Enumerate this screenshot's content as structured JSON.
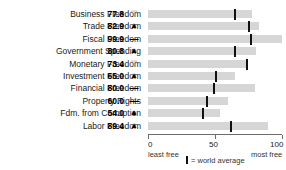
{
  "title_sliver": "ECONOMIC FREEDOM INDICATORS",
  "axis": {
    "ticks": [
      0,
      50,
      100
    ],
    "min_label": "least free",
    "max_label": "most free",
    "range": [
      0,
      100
    ]
  },
  "legend": {
    "marker_name": "world-average-marker",
    "text": "= world average"
  },
  "chart_data": {
    "type": "bar",
    "title": "",
    "xlabel": "",
    "ylabel": "",
    "xlim": [
      0,
      100
    ],
    "grid": false,
    "orientation": "horizontal",
    "legend_position": "bottom",
    "categories": [
      "Business Freedom",
      "Trade Freedom",
      "Fiscal Freedom",
      "Government Spending",
      "Monetary Freedom",
      "Investment Freedom",
      "Financial Freedom",
      "Property Rights",
      "Fdm. from Corruption",
      "Labor Freedom"
    ],
    "values": [
      77.8,
      82.9,
      99.9,
      80.8,
      73.4,
      65.0,
      80.0,
      60.0,
      54.0,
      89.4
    ],
    "value_labels": [
      "77.8",
      "82.9",
      "99.9",
      "80.8",
      "73.4",
      "65.0",
      "80.0",
      "60.0",
      "54.0",
      "89.4"
    ],
    "trends": [
      "down",
      "up",
      "flat",
      "up",
      "down",
      "up",
      "flat",
      "flat",
      "up",
      "up"
    ],
    "trend_glyphs": [
      "▽",
      "▲",
      "—",
      "▲",
      "▽",
      "▲",
      "—",
      "—",
      "▲",
      "▲"
    ],
    "world_average": [
      64.3,
      74.8,
      76.3,
      63.9,
      73.4,
      50.2,
      48.5,
      43.6,
      40.5,
      61.5
    ],
    "series": [
      {
        "name": "country score",
        "values": [
          77.8,
          82.9,
          99.9,
          80.8,
          73.4,
          65.0,
          80.0,
          60.0,
          54.0,
          89.4
        ]
      },
      {
        "name": "world average",
        "values": [
          64.3,
          74.8,
          76.3,
          63.9,
          73.4,
          50.2,
          48.5,
          43.6,
          40.5,
          61.5
        ]
      }
    ],
    "colors": {
      "bar": "#d6d6d6",
      "world_average": "#111111",
      "axis": "#6d6d6d"
    }
  }
}
